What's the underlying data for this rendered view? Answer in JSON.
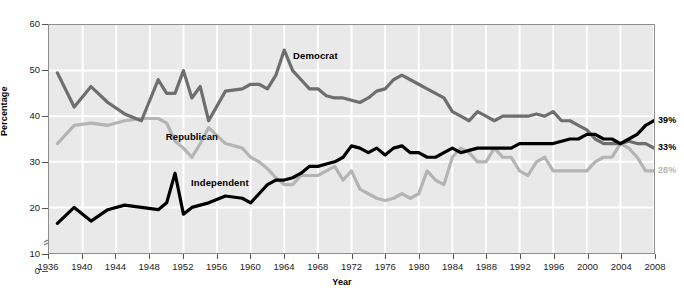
{
  "chart_data": {
    "type": "line",
    "title": "",
    "xlabel": "Year",
    "ylabel": "Percentage",
    "xlim": [
      1936,
      2008
    ],
    "ylim": [
      0,
      60
    ],
    "y_ticks": [
      0,
      10,
      20,
      30,
      40,
      50,
      60
    ],
    "y_axis_break_between": [
      0,
      10
    ],
    "x_ticks": [
      1936,
      1940,
      1944,
      1948,
      1952,
      1956,
      1960,
      1964,
      1968,
      1972,
      1976,
      1980,
      1984,
      1988,
      1992,
      1996,
      2000,
      2004,
      2008
    ],
    "grid": true,
    "legend_position": "inline-annotations",
    "colors": {
      "democrat": "#6e6e6e",
      "republican": "#b4b4b4",
      "independent": "#000000",
      "plot_background": "#e9e9e9",
      "gridline": "#ffffff",
      "frame": "#8e8e8e"
    },
    "series": [
      {
        "name": "Democrat",
        "color": "#6e6e6e",
        "label_x": 1964.6,
        "label_y": 53.0,
        "end_value_label": "33%",
        "x": [
          1937,
          1939,
          1941,
          1943,
          1945,
          1947,
          1949,
          1950,
          1951,
          1952,
          1953,
          1954,
          1955,
          1957,
          1959,
          1960,
          1961,
          1962,
          1963,
          1964,
          1965,
          1966,
          1967,
          1968,
          1969,
          1970,
          1971,
          1972,
          1973,
          1974,
          1975,
          1976,
          1977,
          1978,
          1979,
          1980,
          1981,
          1982,
          1983,
          1984,
          1985,
          1986,
          1987,
          1988,
          1989,
          1990,
          1991,
          1992,
          1993,
          1994,
          1995,
          1996,
          1997,
          1998,
          1999,
          2000,
          2001,
          2002,
          2003,
          2004,
          2005,
          2006,
          2007,
          2008
        ],
        "values": [
          49.5,
          42.0,
          46.5,
          43.0,
          40.5,
          39.0,
          48.0,
          45.0,
          45.0,
          50.0,
          44.0,
          46.5,
          39.0,
          45.5,
          46.0,
          47.0,
          47.0,
          46.0,
          49.0,
          54.5,
          50.0,
          48.0,
          46.0,
          46.0,
          44.5,
          44.0,
          44.0,
          43.5,
          43.0,
          44.0,
          45.5,
          46.0,
          48.0,
          49.0,
          48.0,
          47.0,
          46.0,
          45.0,
          44.0,
          41.0,
          40.0,
          39.0,
          41.0,
          40.0,
          39.0,
          40.0,
          40.0,
          40.0,
          40.0,
          40.5,
          40.0,
          41.0,
          39.0,
          39.0,
          38.0,
          37.0,
          35.0,
          34.0,
          34.0,
          34.0,
          34.5,
          34.0,
          34.0,
          33.0
        ]
      },
      {
        "name": "Republican",
        "color": "#b4b4b4",
        "label_x": 1949.5,
        "label_y": 35.5,
        "end_value_label": "28%",
        "x": [
          1937,
          1939,
          1941,
          1943,
          1945,
          1947,
          1949,
          1950,
          1951,
          1952,
          1953,
          1954,
          1955,
          1957,
          1959,
          1960,
          1961,
          1962,
          1963,
          1964,
          1965,
          1966,
          1967,
          1968,
          1969,
          1970,
          1971,
          1972,
          1973,
          1974,
          1975,
          1976,
          1977,
          1978,
          1979,
          1980,
          1981,
          1982,
          1983,
          1984,
          1985,
          1986,
          1987,
          1988,
          1989,
          1990,
          1991,
          1992,
          1993,
          1994,
          1995,
          1996,
          1997,
          1998,
          1999,
          2000,
          2001,
          2002,
          2003,
          2004,
          2005,
          2006,
          2007,
          2008
        ],
        "values": [
          34.0,
          38.0,
          38.5,
          38.0,
          39.0,
          39.5,
          39.5,
          38.5,
          34.5,
          33.0,
          31.0,
          34.0,
          37.5,
          34.0,
          33.0,
          31.0,
          30.0,
          28.5,
          26.5,
          25.0,
          25.0,
          27.0,
          27.0,
          27.0,
          28.0,
          29.0,
          26.0,
          28.0,
          24.0,
          23.0,
          22.0,
          21.5,
          22.0,
          23.0,
          22.0,
          23.0,
          28.0,
          26.0,
          25.0,
          31.0,
          33.0,
          32.0,
          30.0,
          30.0,
          33.0,
          31.0,
          31.0,
          28.0,
          27.0,
          30.0,
          31.0,
          28.0,
          28.0,
          28.0,
          28.0,
          28.0,
          30.0,
          31.0,
          31.0,
          34.0,
          33.0,
          31.0,
          28.0,
          28.0
        ]
      },
      {
        "name": "Independent",
        "color": "#000000",
        "label_x": 1952.5,
        "label_y": 25.5,
        "end_value_label": "39%",
        "x": [
          1937,
          1939,
          1941,
          1943,
          1945,
          1947,
          1949,
          1950,
          1951,
          1952,
          1953,
          1954,
          1955,
          1957,
          1959,
          1960,
          1961,
          1962,
          1963,
          1964,
          1965,
          1966,
          1967,
          1968,
          1969,
          1970,
          1971,
          1972,
          1973,
          1974,
          1975,
          1976,
          1977,
          1978,
          1979,
          1980,
          1981,
          1982,
          1983,
          1984,
          1985,
          1986,
          1987,
          1988,
          1989,
          1990,
          1991,
          1992,
          1993,
          1994,
          1995,
          1996,
          1997,
          1998,
          1999,
          2000,
          2001,
          2002,
          2003,
          2004,
          2005,
          2006,
          2007,
          2008
        ],
        "values": [
          16.5,
          20.0,
          17.0,
          19.5,
          20.5,
          20.0,
          19.5,
          21.0,
          27.5,
          18.5,
          20.0,
          20.5,
          21.0,
          22.5,
          22.0,
          21.0,
          23.0,
          25.0,
          26.0,
          26.0,
          26.5,
          27.5,
          29.0,
          29.0,
          29.5,
          30.0,
          31.0,
          33.5,
          33.0,
          32.0,
          33.0,
          31.5,
          33.0,
          33.5,
          32.0,
          32.0,
          31.0,
          31.0,
          32.0,
          33.0,
          32.0,
          32.5,
          33.0,
          33.0,
          33.0,
          33.0,
          33.0,
          34.0,
          34.0,
          34.0,
          34.0,
          34.0,
          34.5,
          35.0,
          35.0,
          36.0,
          36.0,
          35.0,
          35.0,
          34.0,
          35.0,
          36.0,
          38.0,
          39.0
        ]
      }
    ]
  }
}
